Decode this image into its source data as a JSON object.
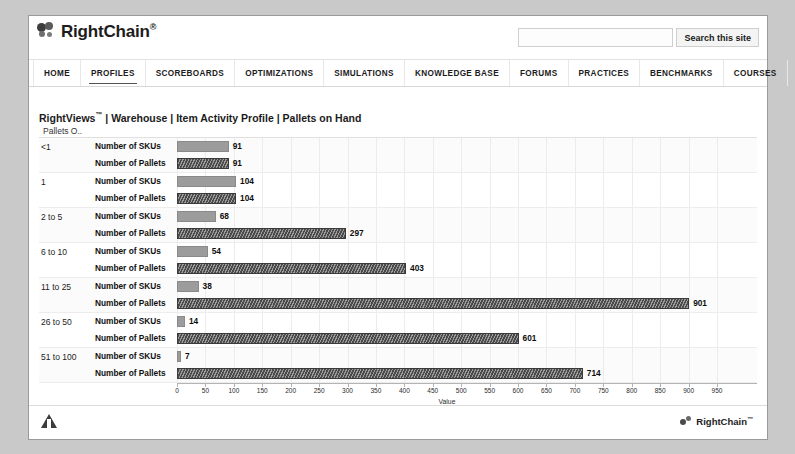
{
  "header": {
    "brand": "RightChain",
    "brand_tm": "®",
    "logo_icon": "gear-cluster-icon",
    "search_placeholder": "",
    "search_value": "",
    "search_button": "Search this site"
  },
  "nav": {
    "items": [
      {
        "label": "HOME",
        "active": false
      },
      {
        "label": "PROFILES",
        "active": true
      },
      {
        "label": "SCOREBOARDS",
        "active": false
      },
      {
        "label": "OPTIMIZATIONS",
        "active": false
      },
      {
        "label": "SIMULATIONS",
        "active": false
      },
      {
        "label": "KNOWLEDGE BASE",
        "active": false
      },
      {
        "label": "FORUMS",
        "active": false
      },
      {
        "label": "PRACTICES",
        "active": false
      },
      {
        "label": "BENCHMARKS",
        "active": false
      },
      {
        "label": "COURSES",
        "active": false
      },
      {
        "label": "HELP",
        "active": false
      }
    ]
  },
  "breadcrumb": {
    "text": "RightViews",
    "tm": "™",
    "trail": " | Warehouse | Item Activity Profile | Pallets on Hand"
  },
  "footer": {
    "brand": "RightChain",
    "brand_tm": "™",
    "left_icon": "triangle-logo-icon",
    "right_icon": "gear-cluster-icon"
  },
  "chart_data": {
    "type": "bar",
    "orientation": "horizontal",
    "title": "Pallets on Hand",
    "ylabel": "Pallets O..",
    "xlabel": "Value",
    "xlim": [
      0,
      950
    ],
    "xticks": [
      0,
      50,
      100,
      150,
      200,
      250,
      300,
      350,
      400,
      450,
      500,
      550,
      600,
      650,
      700,
      750,
      800,
      850,
      900,
      950
    ],
    "grid": true,
    "legend": "none",
    "categories": [
      "<1",
      "1",
      "2 to 5",
      "6 to 10",
      "11 to 25",
      "26 to 50",
      "51 to 100"
    ],
    "series": [
      {
        "name": "Number of SKUs",
        "color": "#9c9c9c",
        "pattern": "solid",
        "values": [
          91,
          104,
          68,
          54,
          38,
          14,
          7
        ]
      },
      {
        "name": "Number of Pallets",
        "color": "#4a4a4a",
        "pattern": "diagonal-hatch",
        "values": [
          91,
          104,
          297,
          403,
          901,
          601,
          714
        ]
      }
    ]
  }
}
